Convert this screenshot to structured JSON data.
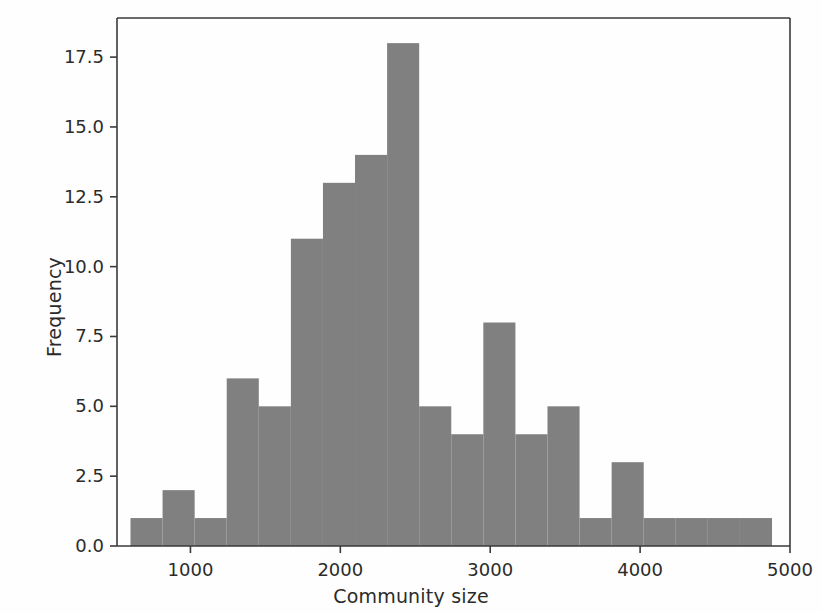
{
  "chart_data": {
    "type": "bar",
    "title": "",
    "subtitle": "",
    "xlabel": "Community size",
    "ylabel": "Frequency",
    "xlim": [
      510,
      5000
    ],
    "ylim": [
      0,
      18.9
    ],
    "grid": false,
    "legend": null,
    "annotations": [],
    "bar_color": "#808080",
    "axis_color": "#3a3a3a",
    "background_color": "#ffffff",
    "xticks": [
      1000,
      2000,
      3000,
      4000,
      5000
    ],
    "xtick_labels": [
      "1000",
      "2000",
      "3000",
      "4000",
      "5000"
    ],
    "yticks": [
      0.0,
      2.5,
      5.0,
      7.5,
      10.0,
      12.5,
      15.0,
      17.5
    ],
    "ytick_labels": [
      "0.0",
      "2.5",
      "5.0",
      "7.5",
      "10.0",
      "12.5",
      "15.0",
      "17.5"
    ],
    "bin_width": 214,
    "bin_edges": [
      600,
      814,
      1028,
      1242,
      1456,
      1670,
      1884,
      2098,
      2312,
      2526,
      2740,
      2954,
      3168,
      3382,
      3596,
      3810,
      4024,
      4238,
      4452,
      4666,
      4880
    ],
    "categories": [
      "600-814",
      "814-1028",
      "1028-1242",
      "1242-1456",
      "1456-1670",
      "1670-1884",
      "1884-2098",
      "2098-2312",
      "2312-2526",
      "2526-2740",
      "2740-2954",
      "2954-3168",
      "3168-3382",
      "3382-3596",
      "3596-3810",
      "3810-4024",
      "4024-4238",
      "4238-4452",
      "4452-4666",
      "4666-4880"
    ],
    "values": [
      1,
      2,
      1,
      6,
      5,
      11,
      13,
      14,
      18,
      5,
      4,
      8,
      4,
      5,
      1,
      3,
      1,
      1,
      1,
      1
    ]
  },
  "axes": {
    "xlabel": "Community size",
    "ylabel": "Frequency"
  }
}
